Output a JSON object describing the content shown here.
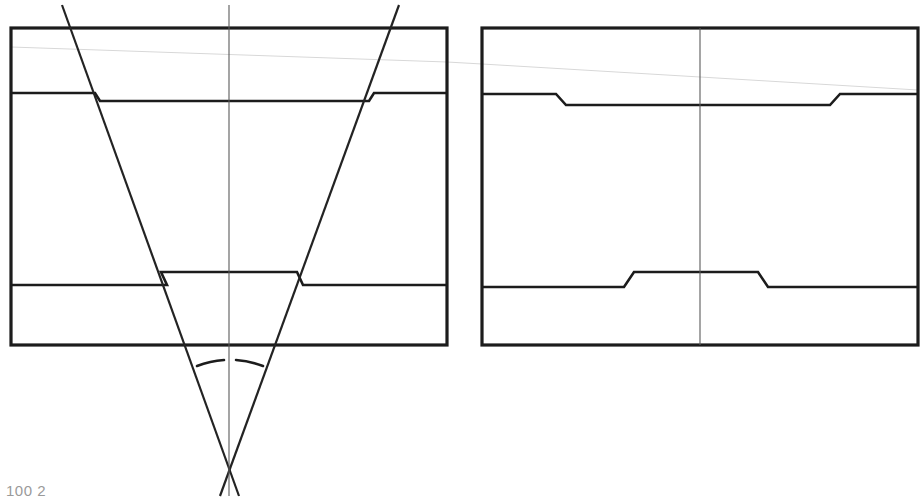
{
  "document": {
    "title": "Two-View Engineering Section Drawing",
    "background_color": "#ffffff",
    "width": 923,
    "height": 501
  },
  "colors": {
    "outline": "#1c1c1c",
    "inner_line": "#1c1c1c",
    "angle_line": "#232323",
    "centerline": "#5a5a5a",
    "construction_line": "#d8d8d8",
    "page_background": "#ffffff"
  },
  "caption": {
    "text": "100 2",
    "visible_partial": true,
    "x": 6,
    "y": 482
  },
  "views": {
    "left": {
      "name": "left-section-view",
      "label": "Left sectional view with converging angle lines",
      "frame": {
        "x1": 11,
        "y1": 28,
        "x2": 447,
        "y2": 345
      },
      "centerline": {
        "x": 229,
        "y1": 5,
        "y2": 496
      },
      "upper_step": {
        "left_y": 93,
        "inner_y": 101,
        "left_break_x": 95,
        "right_break_x": 369,
        "right_y": 93
      },
      "lower_step": {
        "outer_y": 285,
        "inner_y": 272,
        "left_break_x": 161,
        "right_break_x": 297
      },
      "angle_lines": [
        {
          "name": "left-flank",
          "x1": 62,
          "y1": 5,
          "x2": 239,
          "y2": 496
        },
        {
          "name": "right-flank",
          "x1": 399,
          "y1": 5,
          "x2": 220,
          "y2": 496
        }
      ],
      "apex": {
        "x": 229,
        "y": 463
      },
      "angle_arc": {
        "center_x": 229,
        "center_y": 463,
        "radius": 101,
        "start_x": 197,
        "start_y": 366,
        "end_x": 262,
        "end_y": 365,
        "gap_center": true
      }
    },
    "right": {
      "name": "right-section-view",
      "label": "Right sectional view with stepped profile",
      "frame": {
        "x1": 482,
        "y1": 28,
        "x2": 918,
        "y2": 345
      },
      "centerline": {
        "x": 700,
        "y1": 28,
        "y2": 345
      },
      "upper_step": {
        "outer_y": 94,
        "inner_y": 105,
        "left_break_start_x": 556,
        "left_break_end_x": 566,
        "right_break_start_x": 830,
        "right_break_end_x": 840
      },
      "lower_step": {
        "outer_y": 287,
        "inner_y": 272,
        "left_break_start_x": 624,
        "left_break_end_x": 634,
        "right_break_start_x": 758,
        "right_break_end_x": 768
      }
    }
  },
  "construction": {
    "name": "faint-reference-line",
    "segments": [
      {
        "x1": 11,
        "y1": 47,
        "x2": 447,
        "y2": 62
      },
      {
        "x1": 482,
        "y1": 64,
        "x2": 918,
        "y2": 90
      }
    ]
  }
}
